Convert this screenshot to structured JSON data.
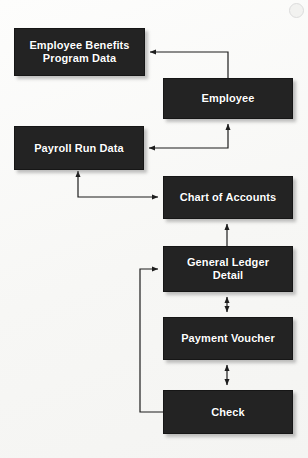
{
  "diagram": {
    "background_color": "#fbfbfa",
    "node_fill_color": "#232323",
    "node_text_color": "#ffffff",
    "edge_color": "#1d1d1d",
    "nodes": [
      {
        "id": "employee-benefits-program-data",
        "label": "Employee Benefits\nProgram Data",
        "x": 14,
        "y": 28,
        "w": 131,
        "h": 48
      },
      {
        "id": "employee",
        "label": "Employee",
        "x": 163,
        "y": 78,
        "w": 130,
        "h": 41
      },
      {
        "id": "payroll-run-data",
        "label": "Payroll Run Data",
        "x": 14,
        "y": 126,
        "w": 130,
        "h": 44
      },
      {
        "id": "chart-of-accounts",
        "label": "Chart of Accounts",
        "x": 163,
        "y": 176,
        "w": 130,
        "h": 43
      },
      {
        "id": "general-ledger-detail",
        "label": "General Ledger\nDetail",
        "x": 163,
        "y": 246,
        "w": 130,
        "h": 46
      },
      {
        "id": "payment-voucher",
        "label": "Payment Voucher",
        "x": 163,
        "y": 317,
        "w": 130,
        "h": 43
      },
      {
        "id": "check",
        "label": "Check",
        "x": 163,
        "y": 390,
        "w": 130,
        "h": 44
      }
    ],
    "edges": [
      {
        "id": "employee-to-benefits",
        "from": "employee",
        "to": "employee-benefits-program-data",
        "arrowheads": "single",
        "direction": "employee-benefits-program-data"
      },
      {
        "id": "payroll-run-data-to-employee",
        "from": "payroll-run-data",
        "to": "employee",
        "arrowheads": "double",
        "direction": "bidirectional"
      },
      {
        "id": "payroll-run-data-to-chart-of-accounts",
        "from": "payroll-run-data",
        "to": "chart-of-accounts",
        "arrowheads": "double",
        "direction": "bidirectional"
      },
      {
        "id": "general-ledger-detail-to-chart-of-accounts",
        "from": "general-ledger-detail",
        "to": "chart-of-accounts",
        "arrowheads": "single",
        "direction": "chart-of-accounts"
      },
      {
        "id": "general-ledger-detail-to-payment-voucher",
        "from": "general-ledger-detail",
        "to": "payment-voucher",
        "arrowheads": "double",
        "direction": "bidirectional"
      },
      {
        "id": "payment-voucher-to-check",
        "from": "payment-voucher",
        "to": "check",
        "arrowheads": "double",
        "direction": "bidirectional"
      },
      {
        "id": "check-to-general-ledger-detail",
        "from": "check",
        "to": "general-ledger-detail",
        "arrowheads": "single",
        "direction": "general-ledger-detail"
      }
    ]
  }
}
